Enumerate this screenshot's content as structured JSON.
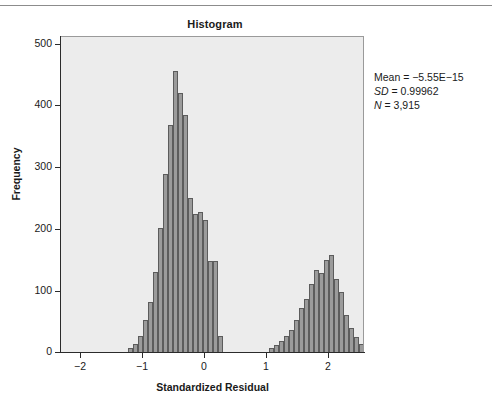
{
  "page": {
    "top_rule": true,
    "background": "#ffffff"
  },
  "chart_data": {
    "type": "bar",
    "subtype": "histogram",
    "title": "Histogram",
    "xlabel": "Standardized Residual",
    "ylabel": "Frequency",
    "xlim": [
      -2.35,
      0.0
    ],
    "xlim_units": [
      -2.35,
      2.55
    ],
    "ylim": [
      0,
      530
    ],
    "grid": false,
    "legend": null,
    "plot_bgcolor": "#ececec",
    "bar_fill": "#9b9b9b",
    "bar_edge": "#5c5c5c",
    "bin_width": 0.08,
    "xticks": [
      -2,
      -1,
      0,
      1,
      2
    ],
    "xticklabels": [
      "-2",
      "-1",
      "0",
      "1",
      "2"
    ],
    "yticks": [
      0,
      100,
      200,
      300,
      400,
      500
    ],
    "yticklabels": [
      "0",
      "100",
      "200",
      "300",
      "400",
      "500"
    ],
    "annotations": [
      {
        "text": "Mean = -5.55E-15",
        "style": "normal"
      },
      {
        "text": "SD = 0.99962",
        "style": "italic-first-token"
      },
      {
        "text": "N = 3,915",
        "style": "italic-first-token"
      }
    ],
    "stats": {
      "mean_label": "Mean = -5.55E-15",
      "sd_symbol": "SD",
      "sd_value": " = 0.99962",
      "n_symbol": "N",
      "n_value": " = 3,915"
    },
    "bins": [
      {
        "x": -1.24,
        "value": 6
      },
      {
        "x": -1.16,
        "value": 12
      },
      {
        "x": -1.08,
        "value": 26
      },
      {
        "x": -1.0,
        "value": 52
      },
      {
        "x": -0.92,
        "value": 82
      },
      {
        "x": -0.84,
        "value": 132
      },
      {
        "x": -0.76,
        "value": 205
      },
      {
        "x": -0.68,
        "value": 295
      },
      {
        "x": -0.6,
        "value": 375
      },
      {
        "x": -0.52,
        "value": 465
      },
      {
        "x": -0.44,
        "value": 428
      },
      {
        "x": -0.36,
        "value": 392
      },
      {
        "x": -0.28,
        "value": 255
      },
      {
        "x": -0.2,
        "value": 228
      },
      {
        "x": -0.12,
        "value": 232
      },
      {
        "x": -0.04,
        "value": 218
      },
      {
        "x": 0.04,
        "value": 150
      },
      {
        "x": 0.12,
        "value": 150
      },
      {
        "x": 0.2,
        "value": 26
      },
      {
        "x": 1.03,
        "value": 6
      },
      {
        "x": 1.11,
        "value": 11
      },
      {
        "x": 1.19,
        "value": 18
      },
      {
        "x": 1.27,
        "value": 26
      },
      {
        "x": 1.35,
        "value": 36
      },
      {
        "x": 1.43,
        "value": 52
      },
      {
        "x": 1.51,
        "value": 72
      },
      {
        "x": 1.59,
        "value": 88
      },
      {
        "x": 1.67,
        "value": 113
      },
      {
        "x": 1.75,
        "value": 136
      },
      {
        "x": 1.83,
        "value": 130
      },
      {
        "x": 1.91,
        "value": 152
      },
      {
        "x": 1.99,
        "value": 160
      },
      {
        "x": 2.07,
        "value": 120
      },
      {
        "x": 2.15,
        "value": 100
      },
      {
        "x": 2.23,
        "value": 62
      },
      {
        "x": 2.31,
        "value": 40
      },
      {
        "x": 2.39,
        "value": 25
      },
      {
        "x": 2.47,
        "value": 14
      }
    ],
    "bars_px": [
      {
        "left": 127,
        "w": 5,
        "h": 4
      },
      {
        "left": 132,
        "w": 5,
        "h": 8
      },
      {
        "left": 137,
        "w": 5,
        "h": 16
      },
      {
        "left": 142,
        "w": 5,
        "h": 32
      },
      {
        "left": 147,
        "w": 5,
        "h": 50
      },
      {
        "left": 152,
        "w": 5,
        "h": 80
      },
      {
        "left": 157,
        "w": 5,
        "h": 124
      },
      {
        "left": 162,
        "w": 5,
        "h": 178
      },
      {
        "left": 167,
        "w": 5,
        "h": 227
      },
      {
        "left": 172,
        "w": 5,
        "h": 281
      },
      {
        "left": 177,
        "w": 5,
        "h": 259
      },
      {
        "left": 182,
        "w": 5,
        "h": 237
      },
      {
        "left": 187,
        "w": 5,
        "h": 154
      },
      {
        "left": 192,
        "w": 5,
        "h": 138
      },
      {
        "left": 197,
        "w": 5,
        "h": 140
      },
      {
        "left": 202,
        "w": 5,
        "h": 132
      },
      {
        "left": 207,
        "w": 5,
        "h": 91
      },
      {
        "left": 212,
        "w": 5,
        "h": 91
      },
      {
        "left": 217,
        "w": 5,
        "h": 16
      },
      {
        "left": 268,
        "w": 5,
        "h": 4
      },
      {
        "left": 273,
        "w": 5,
        "h": 7
      },
      {
        "left": 278,
        "w": 5,
        "h": 11
      },
      {
        "left": 283,
        "w": 5,
        "h": 16
      },
      {
        "left": 288,
        "w": 5,
        "h": 22
      },
      {
        "left": 293,
        "w": 5,
        "h": 32
      },
      {
        "left": 298,
        "w": 5,
        "h": 44
      },
      {
        "left": 303,
        "w": 5,
        "h": 53
      },
      {
        "left": 308,
        "w": 5,
        "h": 68
      },
      {
        "left": 313,
        "w": 5,
        "h": 82
      },
      {
        "left": 318,
        "w": 5,
        "h": 79
      },
      {
        "left": 323,
        "w": 5,
        "h": 92
      },
      {
        "left": 328,
        "w": 5,
        "h": 97
      },
      {
        "left": 333,
        "w": 5,
        "h": 73
      },
      {
        "left": 338,
        "w": 5,
        "h": 60
      },
      {
        "left": 343,
        "w": 5,
        "h": 37
      },
      {
        "left": 348,
        "w": 5,
        "h": 24
      },
      {
        "left": 353,
        "w": 5,
        "h": 15
      },
      {
        "left": 358,
        "w": 5,
        "h": 8
      }
    ],
    "yticks_px": [
      {
        "label": "500",
        "top": 44
      },
      {
        "label": "400",
        "top": 105
      },
      {
        "label": "300",
        "top": 167
      },
      {
        "label": "200",
        "top": 229
      },
      {
        "label": "100",
        "top": 291
      },
      {
        "label": "0",
        "top": 352
      }
    ],
    "xticks_px": [
      {
        "label": "-2",
        "left": 80
      },
      {
        "label": "-1",
        "left": 142
      },
      {
        "label": "0",
        "left": 204
      },
      {
        "label": "1",
        "left": 266
      },
      {
        "label": "2",
        "left": 328
      }
    ]
  }
}
